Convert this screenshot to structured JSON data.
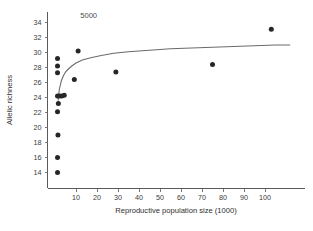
{
  "figure": {
    "annotation": "5000",
    "background_color": "#ffffff",
    "point_color": "#262626",
    "curve_color": "#6b6b6b",
    "axis_color": "#5a5a5a"
  },
  "chart_data": {
    "type": "scatter",
    "title": "",
    "subtitle": "",
    "xlabel": "Reproductive population size (1000)",
    "ylabel": "Allelic richness",
    "xlim": [
      0,
      112
    ],
    "ylim": [
      13,
      35
    ],
    "xticks": [
      10,
      20,
      30,
      40,
      50,
      60,
      70,
      80,
      90,
      100
    ],
    "yticks": [
      14,
      16,
      18,
      20,
      22,
      24,
      26,
      28,
      30,
      32,
      34
    ],
    "xtick_labels": [
      "10",
      "20",
      "30",
      "40",
      "50",
      "60",
      "70",
      "80",
      "90",
      "100"
    ],
    "ytick_labels": [
      "14",
      "16",
      "18",
      "20",
      "22",
      "24",
      "26",
      "28",
      "30",
      "32",
      "34"
    ],
    "grid": false,
    "legend": false,
    "legend_position": "none",
    "annotations": [
      {
        "text": "5000",
        "x": 12,
        "y": 34.6
      }
    ],
    "points": [
      {
        "x": 1.2,
        "y": 29.2
      },
      {
        "x": 1.2,
        "y": 28.2
      },
      {
        "x": 1.2,
        "y": 27.3
      },
      {
        "x": 1.2,
        "y": 24.2
      },
      {
        "x": 2.2,
        "y": 24.2
      },
      {
        "x": 3.2,
        "y": 24.2
      },
      {
        "x": 4.4,
        "y": 24.3
      },
      {
        "x": 1.6,
        "y": 23.2
      },
      {
        "x": 1.2,
        "y": 22.1
      },
      {
        "x": 1.4,
        "y": 19.0
      },
      {
        "x": 1.2,
        "y": 16.0
      },
      {
        "x": 1.2,
        "y": 14.0
      },
      {
        "x": 9.2,
        "y": 26.4
      },
      {
        "x": 11.0,
        "y": 30.2
      },
      {
        "x": 29.0,
        "y": 27.4
      },
      {
        "x": 75.0,
        "y": 28.4
      },
      {
        "x": 103.0,
        "y": 33.1
      }
    ],
    "series": [
      {
        "name": "fitted curve",
        "type": "line",
        "x": [
          1.5,
          2,
          3,
          4,
          5,
          6,
          8,
          10,
          13,
          17,
          22,
          28,
          35,
          45,
          55,
          65,
          75,
          85,
          95,
          105,
          112
        ],
        "y": [
          23.6,
          25.0,
          26.2,
          26.9,
          27.4,
          27.7,
          28.2,
          28.6,
          29.0,
          29.3,
          29.6,
          29.9,
          30.1,
          30.3,
          30.5,
          30.6,
          30.7,
          30.8,
          30.9,
          31.0,
          31.0
        ]
      }
    ]
  }
}
